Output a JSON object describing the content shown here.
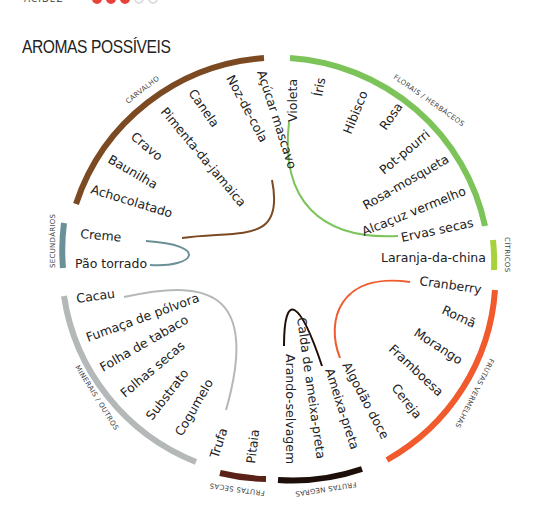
{
  "header": {
    "partial_label": "ACIDEZ",
    "rating_dots": [
      true,
      true,
      true,
      false,
      false
    ]
  },
  "title": "AROMAS POSSÍVEIS",
  "wheel": {
    "categories": [
      {
        "name": "CARVALHO",
        "color": "#7b4a22",
        "aromas": [
          "Açúcar mascavo",
          "Noz-de-cola",
          "Canela",
          "Pimenta-da-jamaica",
          "Cravo",
          "Baunilha",
          "Achocolatado"
        ]
      },
      {
        "name": "FLORAIS / HERBÁCEOS",
        "color": "#7cc45a",
        "aromas": [
          "Violeta",
          "Íris",
          "Hibisco",
          "Rosa",
          "Pot-pourri",
          "Rosa-mosqueta",
          "Alcaçuz vermelho",
          "Ervas secas"
        ]
      },
      {
        "name": "CÍTRICOS",
        "color": "#a8d23c",
        "aromas": [
          "Laranja-da-china"
        ]
      },
      {
        "name": "FRUTAS VERMELHAS",
        "color": "#f05a2c",
        "aromas": [
          "Cranberry",
          "Romã",
          "Morango",
          "Framboesa",
          "Cereja",
          "Algodão doce"
        ]
      },
      {
        "name": "FRUTAS NEGRAS",
        "color": "#1e0e0a",
        "aromas": [
          "Ameixa-preta",
          "Calda de ameixa-preta",
          "Arando-selvagem"
        ]
      },
      {
        "name": "FRUTAS SECAS",
        "color": "#5a2118",
        "aromas": [
          "Pitaia"
        ]
      },
      {
        "name": "MINERAIS / OUTROS",
        "color": "#b5b8b8",
        "aromas": [
          "Trufa",
          "Cogumelo",
          "Substrato",
          "Folhas secas",
          "Folha de tabaco",
          "Fumaça de pólvora",
          "Cacau"
        ]
      },
      {
        "name": "SECUNDÁRIOS",
        "color": "#6b9098",
        "aromas": [
          "Creme",
          "Pão torrado"
        ]
      }
    ]
  }
}
